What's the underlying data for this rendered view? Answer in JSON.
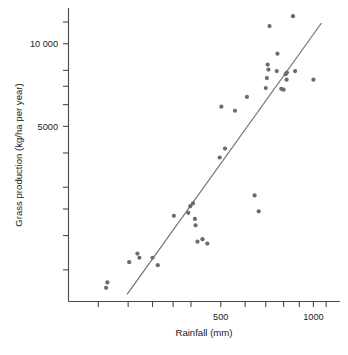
{
  "chart_data": {
    "type": "scatter",
    "title": "",
    "xlabel": "Rainfall (mm)",
    "ylabel": "Grass production (kg/ha per year)",
    "xscale": "log",
    "yscale": "log",
    "xlim": [
      160,
      1220
    ],
    "ylim": [
      1150,
      13500
    ],
    "grid": false,
    "legend": null,
    "x_ticks": [
      200,
      250,
      300,
      350,
      400,
      500,
      600,
      700,
      800,
      900,
      1000,
      1100
    ],
    "x_tick_labels": [
      "",
      "",
      "",
      "",
      "",
      "500",
      "",
      "",
      "",
      "",
      "1000",
      ""
    ],
    "y_ticks": [
      1500,
      2000,
      2500,
      3000,
      4000,
      5000,
      6000,
      7000,
      8000,
      10000,
      12000
    ],
    "y_tick_labels": [
      "",
      "",
      "",
      "",
      "",
      "5000",
      "",
      "",
      "",
      "10 000",
      ""
    ],
    "series": [
      {
        "name": "sites",
        "marker": "filled-circle",
        "color": "#6b6b6b",
        "points": [
          {
            "x": 212,
            "y": 1290
          },
          {
            "x": 214,
            "y": 1350
          },
          {
            "x": 252,
            "y": 1600
          },
          {
            "x": 268,
            "y": 1720
          },
          {
            "x": 272,
            "y": 1660
          },
          {
            "x": 300,
            "y": 1660
          },
          {
            "x": 312,
            "y": 1560
          },
          {
            "x": 352,
            "y": 2360
          },
          {
            "x": 392,
            "y": 2420
          },
          {
            "x": 398,
            "y": 2560
          },
          {
            "x": 406,
            "y": 2620
          },
          {
            "x": 412,
            "y": 2300
          },
          {
            "x": 414,
            "y": 2180
          },
          {
            "x": 420,
            "y": 1900
          },
          {
            "x": 436,
            "y": 1940
          },
          {
            "x": 452,
            "y": 1870
          },
          {
            "x": 496,
            "y": 3850
          },
          {
            "x": 502,
            "y": 5900
          },
          {
            "x": 516,
            "y": 4150
          },
          {
            "x": 556,
            "y": 5700
          },
          {
            "x": 608,
            "y": 6400
          },
          {
            "x": 644,
            "y": 2800
          },
          {
            "x": 664,
            "y": 2450
          },
          {
            "x": 700,
            "y": 6900
          },
          {
            "x": 706,
            "y": 7500
          },
          {
            "x": 710,
            "y": 8400
          },
          {
            "x": 714,
            "y": 8050
          },
          {
            "x": 720,
            "y": 11600
          },
          {
            "x": 760,
            "y": 7950
          },
          {
            "x": 764,
            "y": 9200
          },
          {
            "x": 786,
            "y": 6850
          },
          {
            "x": 800,
            "y": 6800
          },
          {
            "x": 812,
            "y": 7750
          },
          {
            "x": 818,
            "y": 7400
          },
          {
            "x": 820,
            "y": 7850
          },
          {
            "x": 858,
            "y": 12600
          },
          {
            "x": 872,
            "y": 7950
          },
          {
            "x": 1000,
            "y": 7400
          }
        ]
      }
    ],
    "fit_line": {
      "name": "regression-line",
      "color": "#6f6f6f",
      "x_start": 248,
      "y_start": 1220,
      "x_end": 1062,
      "y_end": 11900
    }
  }
}
